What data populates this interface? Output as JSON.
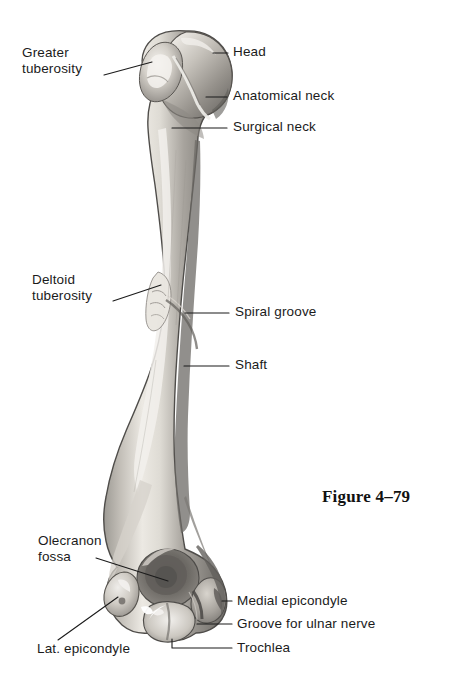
{
  "figure": {
    "caption": "Figure 4–79",
    "view": "posterior",
    "background_color": "#ffffff",
    "text_color": "#1b1b1b",
    "leader_color": "#1b1b1b"
  },
  "labels": {
    "greater_tuberosity": {
      "line1": "Greater",
      "line2": "tuberosity"
    },
    "head": {
      "text": "Head"
    },
    "anatomical_neck": {
      "text": "Anatomical neck"
    },
    "surgical_neck": {
      "text": "Surgical neck"
    },
    "deltoid_tuberosity": {
      "line1": "Deltoid",
      "line2": "tuberosity"
    },
    "spiral_groove": {
      "text": "Spiral groove"
    },
    "shaft": {
      "text": "Shaft"
    },
    "olecranon_fossa": {
      "line1": "Olecranon",
      "line2": "fossa"
    },
    "lat_epicondyle": {
      "text": "Lat. epicondyle"
    },
    "medial_epicondyle": {
      "text": "Medial epicondyle"
    },
    "groove_ulnar_nerve": {
      "text": "Groove for ulnar nerve"
    },
    "trochlea": {
      "text": "Trochlea"
    }
  },
  "bone_shading": {
    "outline": "#4a4a4a",
    "base_light": "#e6e3dd",
    "base_mid": "#b4b0aa",
    "base_dark": "#7d7a75",
    "shadow": "#5c5a57",
    "highlight": "#f4f2ee"
  }
}
